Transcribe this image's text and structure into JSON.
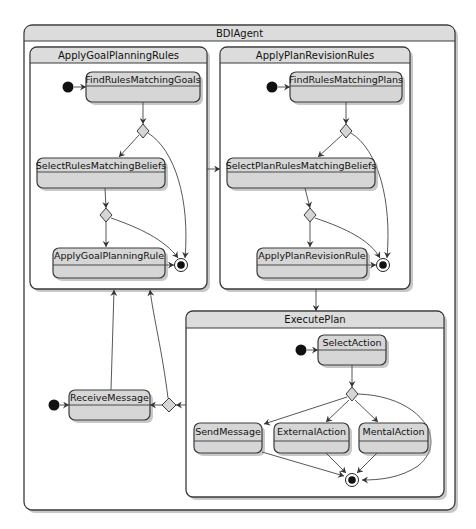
{
  "diagram": {
    "type": "uml-state-machine",
    "root": {
      "title": "BDIAgent"
    },
    "composites": [
      {
        "id": "goal",
        "title": "ApplyGoalPlanningRules",
        "states": [
          "FindRulesMatchingGoals",
          "SelectRulesMatchingBeliefs",
          "ApplyGoalPlanningRule"
        ]
      },
      {
        "id": "revision",
        "title": "ApplyPlanRevisionRules",
        "states": [
          "FindRulesMatchingPlans",
          "SelectPlanRulesMatchingBeliefs",
          "ApplyPlanRevisionRule"
        ]
      },
      {
        "id": "execute",
        "title": "ExecutePlan",
        "states": [
          "SelectAction",
          "SendMessage",
          "ExternalAction",
          "MentalAction"
        ]
      }
    ],
    "top_level_states": [
      "ReceiveMessage"
    ],
    "labels": {
      "bdi_agent": "BDIAgent",
      "apply_goal_planning_rules": "ApplyGoalPlanningRules",
      "find_rules_matching_goals": "FindRulesMatchingGoals",
      "select_rules_matching_beliefs": "SelectRulesMatchingBeliefs",
      "apply_goal_planning_rule": "ApplyGoalPlanningRule",
      "apply_plan_revision_rules": "ApplyPlanRevisionRules",
      "find_rules_matching_plans": "FindRulesMatchingPlans",
      "select_plan_rules_matching_beliefs": "SelectPlanRulesMatchingBeliefs",
      "apply_plan_revision_rule": "ApplyPlanRevisionRule",
      "execute_plan": "ExecutePlan",
      "select_action": "SelectAction",
      "send_message": "SendMessage",
      "external_action": "ExternalAction",
      "mental_action": "MentalAction",
      "receive_message": "ReceiveMessage"
    },
    "transitions": [
      {
        "from": "initial",
        "to": "FindRulesMatchingGoals"
      },
      {
        "from": "FindRulesMatchingGoals",
        "to": "choice-goal-1"
      },
      {
        "from": "choice-goal-1",
        "to": "SelectRulesMatchingBeliefs"
      },
      {
        "from": "choice-goal-1",
        "to": "final-goal"
      },
      {
        "from": "SelectRulesMatchingBeliefs",
        "to": "choice-goal-2"
      },
      {
        "from": "choice-goal-2",
        "to": "ApplyGoalPlanningRule"
      },
      {
        "from": "choice-goal-2",
        "to": "final-goal"
      },
      {
        "from": "ApplyGoalPlanningRule",
        "to": "final-goal"
      },
      {
        "from": "ApplyGoalPlanningRules",
        "to": "ApplyPlanRevisionRules"
      },
      {
        "from": "initial",
        "to": "FindRulesMatchingPlans"
      },
      {
        "from": "FindRulesMatchingPlans",
        "to": "choice-rev-1"
      },
      {
        "from": "choice-rev-1",
        "to": "SelectPlanRulesMatchingBeliefs"
      },
      {
        "from": "choice-rev-1",
        "to": "final-rev"
      },
      {
        "from": "SelectPlanRulesMatchingBeliefs",
        "to": "choice-rev-2"
      },
      {
        "from": "choice-rev-2",
        "to": "ApplyPlanRevisionRule"
      },
      {
        "from": "choice-rev-2",
        "to": "final-rev"
      },
      {
        "from": "ApplyPlanRevisionRule",
        "to": "final-rev"
      },
      {
        "from": "ApplyPlanRevisionRules",
        "to": "ExecutePlan"
      },
      {
        "from": "initial",
        "to": "SelectAction"
      },
      {
        "from": "SelectAction",
        "to": "choice-exec"
      },
      {
        "from": "choice-exec",
        "to": "SendMessage"
      },
      {
        "from": "choice-exec",
        "to": "ExternalAction"
      },
      {
        "from": "choice-exec",
        "to": "MentalAction"
      },
      {
        "from": "choice-exec",
        "to": "final-exec"
      },
      {
        "from": "SendMessage",
        "to": "final-exec"
      },
      {
        "from": "ExternalAction",
        "to": "final-exec"
      },
      {
        "from": "MentalAction",
        "to": "final-exec"
      },
      {
        "from": "ExecutePlan",
        "to": "choice-top"
      },
      {
        "from": "choice-top",
        "to": "ReceiveMessage"
      },
      {
        "from": "choice-top",
        "to": "ApplyGoalPlanningRules"
      },
      {
        "from": "initial",
        "to": "ReceiveMessage"
      },
      {
        "from": "ReceiveMessage",
        "to": "ApplyGoalPlanningRules"
      }
    ],
    "colors": {
      "state_fill": "#d6d6d6",
      "header_fill": "#dcdcdc",
      "stroke": "#3a3a3a",
      "background": "#ffffff"
    }
  }
}
